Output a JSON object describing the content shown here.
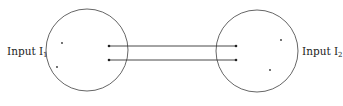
{
  "diagram": {
    "colors": {
      "stroke": "#555555",
      "line": "#333333",
      "dot": "#222222",
      "text": "#222222"
    },
    "left": {
      "label": "Input I",
      "subscript": "1",
      "circle": {
        "cx": 87,
        "cy": 50,
        "r": 41
      },
      "points": [
        {
          "x": 62,
          "y": 43
        },
        {
          "x": 57,
          "y": 67
        }
      ]
    },
    "right": {
      "label": "Input I",
      "subscript": "2",
      "circle": {
        "cx": 257,
        "cy": 51,
        "r": 41
      },
      "points": [
        {
          "x": 281,
          "y": 40
        },
        {
          "x": 270,
          "y": 70
        }
      ]
    },
    "connections": [
      {
        "x1": 109,
        "y1": 46,
        "x2": 236,
        "y2": 46
      },
      {
        "x1": 109,
        "y1": 60,
        "x2": 236,
        "y2": 60
      }
    ]
  }
}
